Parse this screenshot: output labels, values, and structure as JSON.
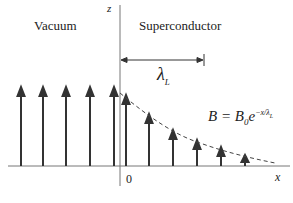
{
  "labels": {
    "vacuum": "Vacuum",
    "superconductor": "Superconductor",
    "z_axis": "z",
    "x_axis": "x",
    "origin": "0",
    "penetration_depth": "λ",
    "penetration_depth_sub": "L",
    "equation_lhs": "B = B",
    "equation_sub": "0",
    "equation_base": "e",
    "equation_exp": "−x/λ",
    "equation_exp_sub": "L"
  },
  "colors": {
    "arrow": "#333333",
    "axis": "#555555",
    "curve": "#444444"
  }
}
